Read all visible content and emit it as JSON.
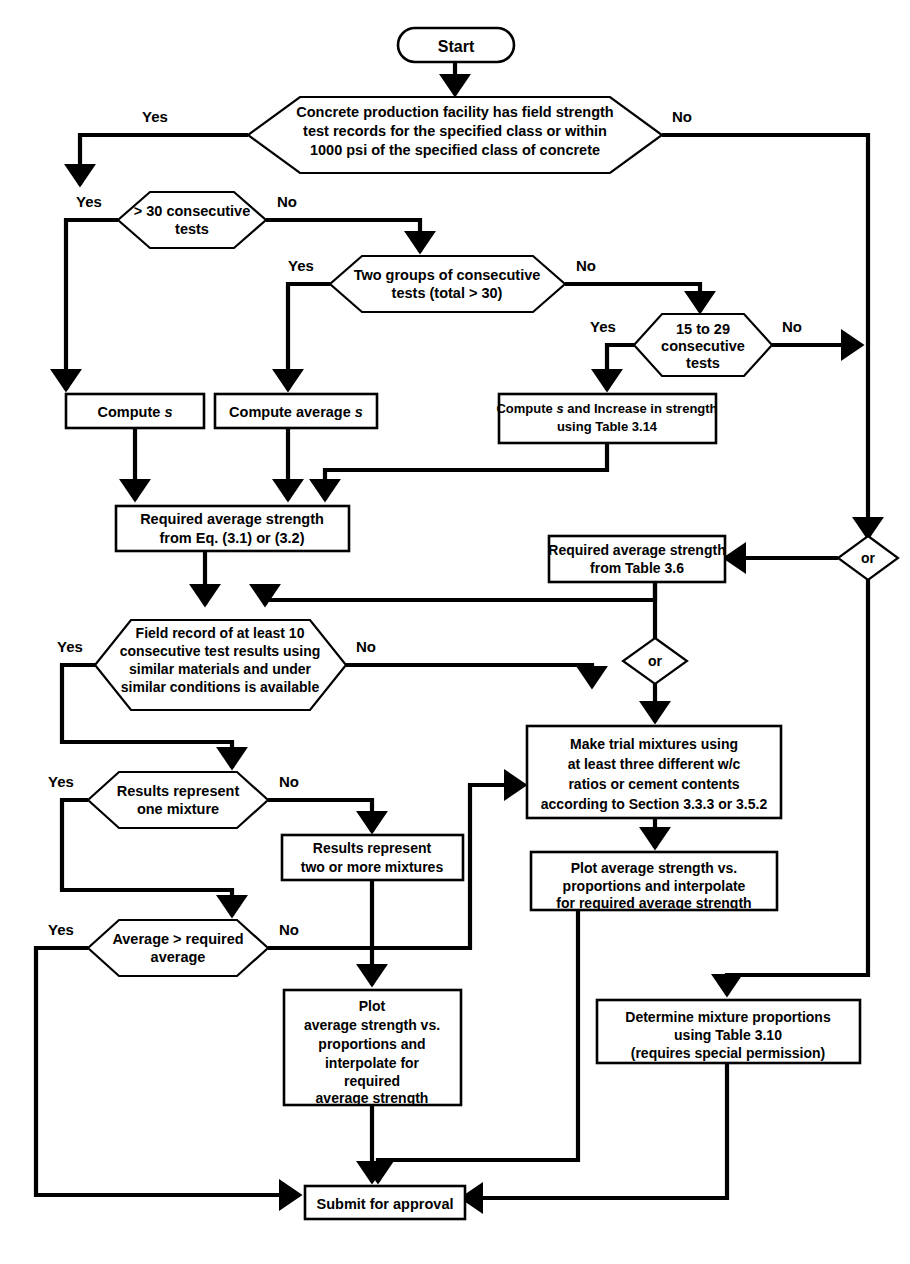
{
  "diagram": {
    "colors": {
      "line": "#000000",
      "fill": "#ffffff",
      "background": "#ffffff"
    },
    "nodes": {
      "start": {
        "label": "Start",
        "shape": "stadium"
      },
      "d1": {
        "label": "Concrete production facility has field strength|test records for the specified class or within|1000 psi of the specified class of concrete",
        "shape": "hexagon"
      },
      "d2": {
        "label": "> 30 consecutive|tests",
        "shape": "hexagon"
      },
      "d3": {
        "label": "Two groups of consecutive|tests (total > 30)",
        "shape": "hexagon"
      },
      "d4": {
        "label": "15 to 29|consecutive|tests",
        "shape": "hexagon"
      },
      "computeS": {
        "label": "Compute s",
        "shape": "rect"
      },
      "computeAvgS": {
        "label": "Compute average s",
        "shape": "rect"
      },
      "computeTable": {
        "label": "Compute s and Increase in strength|using Table 3.14",
        "shape": "rect"
      },
      "reqEq": {
        "label": "Required average strength|from Eq. (3.1) or (3.2)",
        "shape": "rect"
      },
      "reqTable": {
        "label": "Required average strength|from Table 3.6",
        "shape": "rect"
      },
      "or1": {
        "label": "or",
        "shape": "diamond"
      },
      "or2": {
        "label": "or",
        "shape": "diamond"
      },
      "d5": {
        "label": "Field record of at least 10|consecutive test results using|similar materials and under|similar conditions is available",
        "shape": "hexagon"
      },
      "d6": {
        "label": "Results represent|one mixture",
        "shape": "hexagon"
      },
      "d7": {
        "label": "Average > required|average",
        "shape": "hexagon"
      },
      "trial": {
        "label": "Make trial mixtures using|at least three different w/c|ratios or cement contents|according to Section 3.3.3 or 3.5.2",
        "shape": "rect"
      },
      "resultsTwo": {
        "label": "Results represent|two or more mixtures",
        "shape": "rect"
      },
      "plotRight": {
        "label": "Plot average strength vs.|proportions and interpolate|for required average strength",
        "shape": "rect"
      },
      "plotLeft": {
        "label": "Plot|average strength vs.|proportions and|interpolate for|required|average strength",
        "shape": "rect"
      },
      "determine": {
        "label": "Determine mixture proportions|using Table 3.10|(requires special permission)",
        "shape": "rect"
      },
      "submit": {
        "label": "Submit for approval",
        "shape": "rect"
      }
    },
    "branch_labels": {
      "d1_yes": "Yes",
      "d1_no": "No",
      "d2_yes": "Yes",
      "d2_no": "No",
      "d3_yes": "Yes",
      "d3_no": "No",
      "d4_yes": "Yes",
      "d4_no": "No",
      "d5_yes": "Yes",
      "d5_no": "No",
      "d6_yes": "Yes",
      "d6_no": "No",
      "d7_yes": "Yes",
      "d7_no": "No"
    }
  }
}
